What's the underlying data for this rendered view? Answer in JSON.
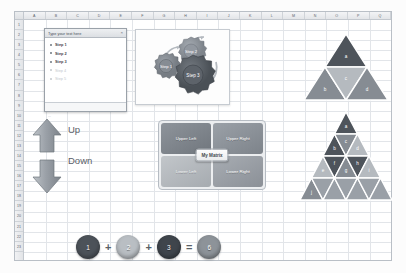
{
  "spreadsheet": {
    "columns": [
      "A",
      "B",
      "C",
      "D",
      "E",
      "F",
      "G",
      "H",
      "I",
      "J",
      "K",
      "L",
      "M",
      "N",
      "O",
      "P",
      "Q"
    ],
    "rows": [
      "1",
      "2",
      "3",
      "4",
      "5",
      "6",
      "7",
      "8",
      "9",
      "10",
      "11",
      "12",
      "13",
      "14",
      "15",
      "16",
      "17",
      "18",
      "19",
      "20",
      "21",
      "22",
      "23"
    ],
    "corner_label": "",
    "gridline_color": "#e2e5e9",
    "header_color": "#5c636b"
  },
  "text_pane": {
    "title": "Type your text here",
    "close_label": "×",
    "items": [
      {
        "label": "Step 1",
        "placeholder": false
      },
      {
        "label": "Step 2",
        "placeholder": false
      },
      {
        "label": "Step 3",
        "placeholder": false
      },
      {
        "label": "Step 4",
        "placeholder": true
      },
      {
        "label": "Step 5",
        "placeholder": true
      }
    ],
    "footer_hint": "..."
  },
  "gear_diagram": {
    "gears": [
      {
        "label": "Step 1",
        "size": "small"
      },
      {
        "label": "Step 2",
        "size": "medium"
      },
      {
        "label": "Step 3",
        "size": "large"
      }
    ],
    "colors": {
      "small": "#8f959c",
      "medium": "#9aa0a7",
      "large": "#575d64"
    }
  },
  "arrows": {
    "up_label": "Up",
    "down_label": "Down",
    "fill": "#9aa0a7",
    "label_color": "#5a6068"
  },
  "matrix": {
    "center_label": "My Matrix",
    "quadrants": [
      {
        "label": "Upper Left",
        "position": "ul"
      },
      {
        "label": "Upper Right",
        "position": "ur"
      },
      {
        "label": "Lower Left",
        "position": "ll"
      },
      {
        "label": "Lower Right",
        "position": "lr"
      }
    ]
  },
  "pyramid_small": {
    "rows": 2,
    "cells": [
      {
        "label": "a",
        "tone": "dark"
      },
      {
        "label": "b",
        "tone": "mid"
      },
      {
        "label": "c",
        "tone": "light"
      },
      {
        "label": "d",
        "tone": "mid"
      }
    ]
  },
  "pyramid_large": {
    "rows": 4,
    "cells": [
      {
        "label": "a",
        "tone": "dark"
      },
      {
        "label": "b",
        "tone": "dark"
      },
      {
        "label": "c",
        "tone": "mid"
      },
      {
        "label": "d",
        "tone": "light"
      },
      {
        "label": "e",
        "tone": "light"
      },
      {
        "label": "f",
        "tone": "dark"
      },
      {
        "label": "g",
        "tone": "mid"
      },
      {
        "label": "h",
        "tone": "dark"
      },
      {
        "label": "i",
        "tone": "light"
      },
      {
        "label": "j",
        "tone": "mid"
      }
    ]
  },
  "equation": {
    "terms": [
      {
        "value": "1",
        "color": "#4c5259"
      },
      {
        "op": "+"
      },
      {
        "value": "2",
        "color": "#b9bec3"
      },
      {
        "op": "+"
      },
      {
        "value": "3",
        "color": "#3f454c"
      },
      {
        "op": "="
      },
      {
        "value": "6",
        "color": "#8d9399"
      }
    ]
  }
}
